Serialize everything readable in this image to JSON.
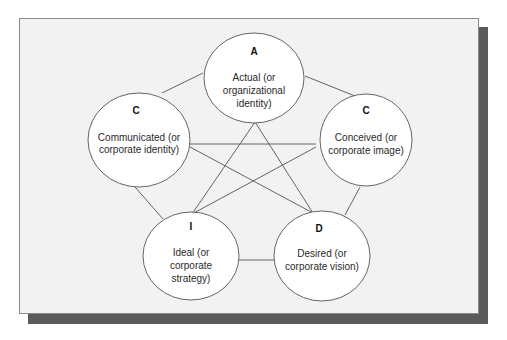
{
  "diagram": {
    "type": "pentagram-network",
    "nodes": [
      {
        "id": "A",
        "letter": "A",
        "lines": [
          "Actual (or",
          "organizational",
          "identity)"
        ]
      },
      {
        "id": "C1",
        "letter": "C",
        "lines": [
          "Communicated (or",
          "corporate identity)"
        ]
      },
      {
        "id": "C2",
        "letter": "C",
        "lines": [
          "Conceived (or",
          "corporate image)"
        ]
      },
      {
        "id": "I",
        "letter": "I",
        "lines": [
          "Ideal (or",
          "corporate",
          "strategy)"
        ]
      },
      {
        "id": "D",
        "letter": "D",
        "lines": [
          "Desired (or",
          "corporate vision)"
        ]
      }
    ],
    "edges": [
      [
        "A",
        "C1"
      ],
      [
        "A",
        "C2"
      ],
      [
        "C1",
        "I"
      ],
      [
        "C2",
        "D"
      ],
      [
        "I",
        "D"
      ],
      [
        "A",
        "I"
      ],
      [
        "A",
        "D"
      ],
      [
        "C1",
        "C2"
      ],
      [
        "C1",
        "D"
      ],
      [
        "C2",
        "I"
      ]
    ]
  }
}
